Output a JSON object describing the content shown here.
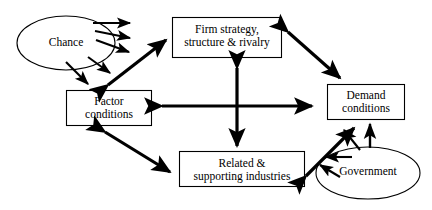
{
  "diagram": {
    "type": "node-link-diagram",
    "background_color": "#ffffff",
    "stroke_color": "#000000",
    "nodes": [
      {
        "id": "firm-strategy",
        "shape": "rectangle",
        "line1": "Firm strategy,",
        "line2": "structure & rivalry"
      },
      {
        "id": "factor-conditions",
        "shape": "rectangle",
        "line1": "Factor",
        "line2": "conditions"
      },
      {
        "id": "demand-conditions",
        "shape": "rectangle",
        "line1": "Demand",
        "line2": "conditions"
      },
      {
        "id": "related-industries",
        "shape": "rectangle",
        "line1": "Related &",
        "line2": "supporting industries"
      },
      {
        "id": "chance",
        "shape": "ellipse",
        "line1": "Chance",
        "line2": ""
      },
      {
        "id": "government",
        "shape": "ellipse",
        "line1": "Government",
        "line2": ""
      }
    ],
    "edges": [
      {
        "from": "factor-conditions",
        "to": "firm-strategy",
        "heads": "both"
      },
      {
        "from": "firm-strategy",
        "to": "demand-conditions",
        "heads": "both"
      },
      {
        "from": "factor-conditions",
        "to": "related-industries",
        "heads": "both"
      },
      {
        "from": "related-industries",
        "to": "demand-conditions",
        "heads": "both"
      },
      {
        "from": "center",
        "to": "horizontal",
        "heads": "both"
      },
      {
        "from": "center",
        "to": "vertical",
        "heads": "both"
      },
      {
        "from": "chance",
        "to": "fan-1",
        "heads": "end"
      },
      {
        "from": "chance",
        "to": "fan-2",
        "heads": "end"
      },
      {
        "from": "chance",
        "to": "fan-3",
        "heads": "end"
      },
      {
        "from": "chance",
        "to": "fan-4",
        "heads": "end"
      },
      {
        "from": "chance",
        "to": "fan-5",
        "heads": "end"
      },
      {
        "from": "government",
        "to": "demand-conditions",
        "heads": "end"
      },
      {
        "from": "government",
        "to": "gov-fan-1",
        "heads": "end"
      },
      {
        "from": "government",
        "to": "gov-fan-2",
        "heads": "end"
      },
      {
        "from": "government",
        "to": "gov-fan-3",
        "heads": "end"
      }
    ]
  }
}
